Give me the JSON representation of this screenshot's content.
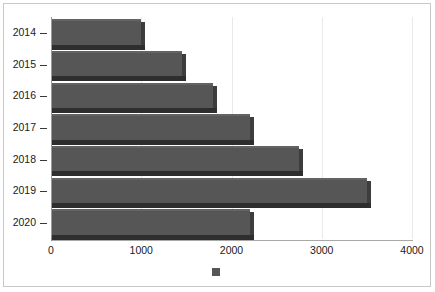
{
  "chart_data": {
    "type": "bar",
    "orientation": "horizontal",
    "title": "",
    "subtitle": "",
    "xlabel": "",
    "ylabel": "",
    "categories": [
      "2014",
      "2015",
      "2016",
      "2017",
      "2018",
      "2019",
      "2020"
    ],
    "values": [
      1000,
      1450,
      1800,
      2200,
      2750,
      3500,
      2200
    ],
    "series": [
      {
        "name": "",
        "values": [
          1000,
          1450,
          1800,
          2200,
          2750,
          3500,
          2200
        ],
        "color": "#565656"
      }
    ],
    "xlim": [
      0,
      4000
    ],
    "xticks": [
      0,
      1000,
      2000,
      3000,
      4000
    ],
    "xtick_labels": [
      "0",
      "1000",
      "2000",
      "3000",
      "4000"
    ],
    "ytick_labels": [
      "2014",
      "2015",
      "2016",
      "2017",
      "2018",
      "2019",
      "2020"
    ],
    "grid": true,
    "grid_axis": "x",
    "legend": {
      "position": "bottom",
      "entries": [
        {
          "label": "",
          "color": "#565656"
        }
      ]
    },
    "style": {
      "bar_color": "#565656",
      "bar_shadow_color": "#2e2e2e",
      "bar_side_color": "#3d3d3d",
      "gridline_color": "#e9e9e9",
      "axis_color": "#9a9a9a",
      "frame_color": "#c8c8c8",
      "background": "#ffffff",
      "text_color": "#1a1a1a",
      "three_d": true
    }
  }
}
